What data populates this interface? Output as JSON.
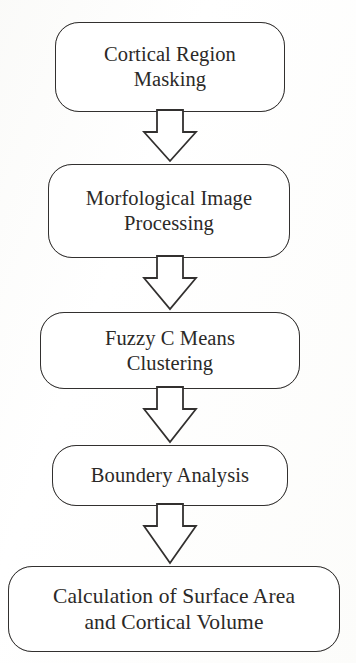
{
  "diagram": {
    "type": "flowchart",
    "orientation": "vertical-top-down",
    "canvas": {
      "width": 356,
      "height": 663
    },
    "style": {
      "node_shape": "rounded-rectangle",
      "node_fill": "#ffffff",
      "stroke_color": "#32302f",
      "text_color": "#2b2927",
      "background": "#fdfdfd",
      "connector_style": "hollow-block-arrow"
    },
    "nodes": [
      {
        "id": "cortical-region-masking",
        "label": "Cortical Region\nMasking",
        "line1": "Cortical Region",
        "line2": "Masking",
        "order": 1
      },
      {
        "id": "morfological-image-processing",
        "label": "Morfological Image\nProcessing",
        "line1": "Morfological Image",
        "line2": "Processing",
        "order": 2
      },
      {
        "id": "fuzzy-c-means-clustering",
        "label": "Fuzzy C Means\nClustering",
        "line1": "Fuzzy C Means",
        "line2": "Clustering",
        "order": 3
      },
      {
        "id": "boundery-analysis",
        "label": "Boundery Analysis",
        "line1": "Boundery Analysis",
        "line2": "",
        "order": 4
      },
      {
        "id": "calculation-of-surface-area-and-cortical-volume",
        "label": "Calculation of Surface Area\nand Cortical Volume",
        "line1": "Calculation of Surface Area",
        "line2": "and Cortical Volume",
        "order": 5
      }
    ],
    "edges": [
      {
        "id": "edge-1",
        "from": "cortical-region-masking",
        "to": "morfological-image-processing",
        "label": ""
      },
      {
        "id": "edge-2",
        "from": "morfological-image-processing",
        "to": "fuzzy-c-means-clustering",
        "label": ""
      },
      {
        "id": "edge-3",
        "from": "fuzzy-c-means-clustering",
        "to": "boundery-analysis",
        "label": ""
      },
      {
        "id": "edge-4",
        "from": "boundery-analysis",
        "to": "calculation-of-surface-area-and-cortical-volume",
        "label": ""
      }
    ]
  }
}
